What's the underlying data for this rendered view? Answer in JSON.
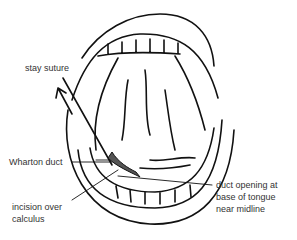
{
  "diagram": {
    "labels": {
      "stay_suture": "stay suture",
      "wharton_duct": "Wharton duct",
      "incision_line1": "incision over",
      "incision_line2": "calculus",
      "duct_opening_line1": "duct opening at",
      "duct_opening_line2": "base of tongue",
      "duct_opening_line3": "near midline"
    },
    "colors": {
      "line": "#111111",
      "text": "#333333",
      "duct_fill": "#555555"
    }
  }
}
